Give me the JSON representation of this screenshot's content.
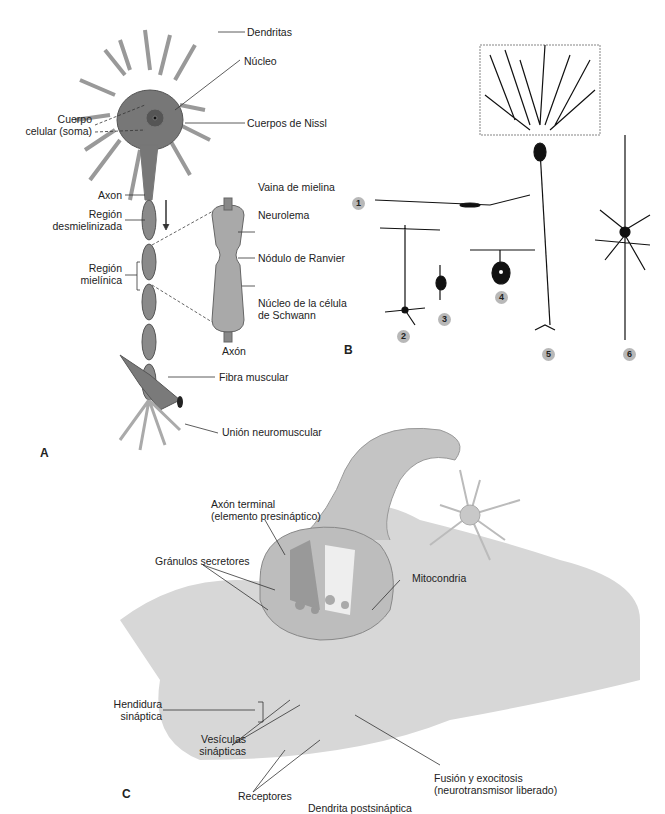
{
  "panels": {
    "A": {
      "letter": "A",
      "labels": {
        "dendritas": "Dendritas",
        "nucleo": "Núcleo",
        "cuerpo1": "Cuerpo",
        "cuerpo2": "celular (soma)",
        "nissl": "Cuerpos de Nissl",
        "axon": "Axon",
        "desmiel1": "Región",
        "desmiel2": "desmielinizada",
        "miel1": "Región",
        "miel2": "mielínica",
        "vaina": "Vaina de mielina",
        "neurolema": "Neurolema",
        "ranvier": "Nódulo de Ranvier",
        "schwann1": "Núcleo de la célula",
        "schwann2": "de Schwann",
        "axon2": "Axón",
        "fibra": "Fibra muscular",
        "union": "Unión neuromuscular"
      }
    },
    "B": {
      "letter": "B",
      "badges": [
        "1",
        "2",
        "3",
        "4",
        "5",
        "6"
      ]
    },
    "C": {
      "letter": "C",
      "labels": {
        "axon_t1": "Axón terminal",
        "axon_t2": "(elemento presináptico)",
        "granulos": "Gránulos secretores",
        "mito": "Mitocondria",
        "hend1": "Hendidura",
        "hend2": "sináptica",
        "vesic1": "Vesículas",
        "vesic2": "sinápticas",
        "recept": "Receptores",
        "dendrita": "Dendrita postsináptica",
        "fusion1": "Fusión y exocitosis",
        "fusion2": "(neurotransmisor liberado)"
      }
    }
  }
}
